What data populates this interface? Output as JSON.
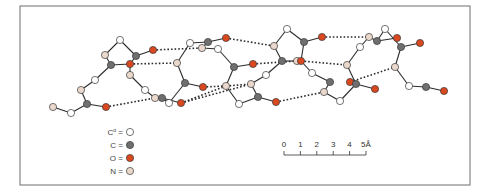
{
  "figure": {
    "frame": {
      "x": 20,
      "y": 6,
      "w": 450,
      "h": 179,
      "stroke": "#6e6e6e"
    },
    "colors": {
      "calpha": "#ffffff",
      "carbon": "#6f6f6f",
      "oxygen": "#d9481f",
      "nitrogen": "#ead8cc",
      "atom_stroke": "#3a3a3a",
      "bond": "#2b2b2b",
      "hbond": "#2b2b2b"
    },
    "atoms": [
      {
        "id": "a1",
        "type": "N",
        "x": 53,
        "y": 107
      },
      {
        "id": "a2",
        "type": "CA",
        "x": 71,
        "y": 113
      },
      {
        "id": "a3",
        "type": "C",
        "x": 87,
        "y": 104
      },
      {
        "id": "a4",
        "type": "O",
        "x": 106,
        "y": 107
      },
      {
        "id": "a5",
        "type": "N",
        "x": 81,
        "y": 90
      },
      {
        "id": "a6",
        "type": "CA",
        "x": 95,
        "y": 80
      },
      {
        "id": "a7",
        "type": "C",
        "x": 111,
        "y": 65
      },
      {
        "id": "a8",
        "type": "N",
        "x": 105,
        "y": 55
      },
      {
        "id": "a9",
        "type": "CA",
        "x": 120,
        "y": 40
      },
      {
        "id": "a10",
        "type": "C",
        "x": 136,
        "y": 56
      },
      {
        "id": "a11",
        "type": "O",
        "x": 153,
        "y": 50
      },
      {
        "id": "a12",
        "type": "O",
        "x": 130,
        "y": 64
      },
      {
        "id": "a13",
        "type": "N",
        "x": 130,
        "y": 75
      },
      {
        "id": "a14",
        "type": "CA",
        "x": 145,
        "y": 90
      },
      {
        "id": "a15",
        "type": "N",
        "x": 155,
        "y": 98
      },
      {
        "id": "a16",
        "type": "C",
        "x": 162,
        "y": 98
      },
      {
        "id": "a17",
        "type": "CA",
        "x": 169,
        "y": 103
      },
      {
        "id": "a18",
        "type": "O",
        "x": 181,
        "y": 103
      },
      {
        "id": "a19",
        "type": "C",
        "x": 185,
        "y": 83
      },
      {
        "id": "a20",
        "type": "O",
        "x": 203,
        "y": 87
      },
      {
        "id": "a21",
        "type": "N",
        "x": 177,
        "y": 63
      },
      {
        "id": "a22",
        "type": "CA",
        "x": 190,
        "y": 43
      },
      {
        "id": "a23",
        "type": "N",
        "x": 202,
        "y": 48
      },
      {
        "id": "a24",
        "type": "C",
        "x": 208,
        "y": 42
      },
      {
        "id": "a25",
        "type": "O",
        "x": 226,
        "y": 38
      },
      {
        "id": "a26",
        "type": "CA",
        "x": 218,
        "y": 49
      },
      {
        "id": "a27",
        "type": "C",
        "x": 234,
        "y": 67
      },
      {
        "id": "a28",
        "type": "O",
        "x": 253,
        "y": 64
      },
      {
        "id": "a29",
        "type": "N",
        "x": 226,
        "y": 86
      },
      {
        "id": "a30",
        "type": "CA",
        "x": 239,
        "y": 104
      },
      {
        "id": "a31",
        "type": "C",
        "x": 258,
        "y": 97
      },
      {
        "id": "a32",
        "type": "O",
        "x": 276,
        "y": 102
      },
      {
        "id": "a33",
        "type": "N",
        "x": 251,
        "y": 84
      },
      {
        "id": "a34",
        "type": "CA",
        "x": 266,
        "y": 75
      },
      {
        "id": "a35",
        "type": "C",
        "x": 282,
        "y": 61
      },
      {
        "id": "a36",
        "type": "N",
        "x": 297,
        "y": 61
      },
      {
        "id": "a37",
        "type": "O",
        "x": 301,
        "y": 61
      },
      {
        "id": "a38",
        "type": "N",
        "x": 274,
        "y": 46
      },
      {
        "id": "a39",
        "type": "CA",
        "x": 287,
        "y": 29
      },
      {
        "id": "a40",
        "type": "C",
        "x": 304,
        "y": 42
      },
      {
        "id": "a41",
        "type": "O",
        "x": 322,
        "y": 37
      },
      {
        "id": "a42",
        "type": "CA",
        "x": 312,
        "y": 73
      },
      {
        "id": "a43",
        "type": "C",
        "x": 330,
        "y": 82
      },
      {
        "id": "a44",
        "type": "N",
        "x": 324,
        "y": 92
      },
      {
        "id": "a45",
        "type": "CA",
        "x": 340,
        "y": 101
      },
      {
        "id": "a46",
        "type": "O",
        "x": 350,
        "y": 82
      },
      {
        "id": "a47",
        "type": "C",
        "x": 356,
        "y": 84
      },
      {
        "id": "a48",
        "type": "O",
        "x": 375,
        "y": 89
      },
      {
        "id": "a49",
        "type": "N",
        "x": 347,
        "y": 65
      },
      {
        "id": "a50",
        "type": "CA",
        "x": 360,
        "y": 47
      },
      {
        "id": "a51",
        "type": "N",
        "x": 369,
        "y": 37
      },
      {
        "id": "a52",
        "type": "C",
        "x": 377,
        "y": 41
      },
      {
        "id": "a53",
        "type": "CA",
        "x": 385,
        "y": 29
      },
      {
        "id": "a54",
        "type": "O",
        "x": 397,
        "y": 38
      },
      {
        "id": "a55",
        "type": "C",
        "x": 401,
        "y": 47
      },
      {
        "id": "a56",
        "type": "O",
        "x": 420,
        "y": 43
      },
      {
        "id": "a57",
        "type": "N",
        "x": 395,
        "y": 67
      },
      {
        "id": "a58",
        "type": "CA",
        "x": 409,
        "y": 86
      },
      {
        "id": "a59",
        "type": "C",
        "x": 426,
        "y": 87
      },
      {
        "id": "a60",
        "type": "O",
        "x": 444,
        "y": 91
      }
    ],
    "bonds": [
      [
        "a1",
        "a2"
      ],
      [
        "a2",
        "a3"
      ],
      [
        "a3",
        "a4"
      ],
      [
        "a3",
        "a5"
      ],
      [
        "a5",
        "a6"
      ],
      [
        "a6",
        "a7"
      ],
      [
        "a7",
        "a8"
      ],
      [
        "a8",
        "a9"
      ],
      [
        "a9",
        "a10"
      ],
      [
        "a10",
        "a11"
      ],
      [
        "a7",
        "a12"
      ],
      [
        "a10",
        "a12"
      ],
      [
        "a12",
        "a13"
      ],
      [
        "a13",
        "a14"
      ],
      [
        "a14",
        "a15"
      ],
      [
        "a15",
        "a16"
      ],
      [
        "a16",
        "a17"
      ],
      [
        "a17",
        "a19"
      ],
      [
        "a19",
        "a20"
      ],
      [
        "a19",
        "a21"
      ],
      [
        "a21",
        "a22"
      ],
      [
        "a22",
        "a24"
      ],
      [
        "a23",
        "a24"
      ],
      [
        "a24",
        "a25"
      ],
      [
        "a23",
        "a26"
      ],
      [
        "a26",
        "a27"
      ],
      [
        "a27",
        "a28"
      ],
      [
        "a27",
        "a29"
      ],
      [
        "a29",
        "a30"
      ],
      [
        "a30",
        "a31"
      ],
      [
        "a31",
        "a32"
      ],
      [
        "a31",
        "a33"
      ],
      [
        "a33",
        "a34"
      ],
      [
        "a34",
        "a35"
      ],
      [
        "a35",
        "a38"
      ],
      [
        "a38",
        "a39"
      ],
      [
        "a39",
        "a40"
      ],
      [
        "a40",
        "a41"
      ],
      [
        "a35",
        "a36"
      ],
      [
        "a40",
        "a37"
      ],
      [
        "a37",
        "a42"
      ],
      [
        "a42",
        "a43"
      ],
      [
        "a43",
        "a44"
      ],
      [
        "a44",
        "a45"
      ],
      [
        "a45",
        "a47"
      ],
      [
        "a46",
        "a47"
      ],
      [
        "a47",
        "a48"
      ],
      [
        "a47",
        "a49"
      ],
      [
        "a49",
        "a50"
      ],
      [
        "a50",
        "a51"
      ],
      [
        "a51",
        "a52"
      ],
      [
        "a52",
        "a53"
      ],
      [
        "a53",
        "a55"
      ],
      [
        "a52",
        "a54"
      ],
      [
        "a55",
        "a56"
      ],
      [
        "a55",
        "a57"
      ],
      [
        "a57",
        "a58"
      ],
      [
        "a58",
        "a59"
      ],
      [
        "a59",
        "a60"
      ],
      [
        "a16",
        "a18"
      ]
    ],
    "hbonds": [
      [
        "a4",
        "a15"
      ],
      [
        "a11",
        "a23"
      ],
      [
        "a12",
        "a21"
      ],
      [
        "a18",
        "a29"
      ],
      [
        "a20",
        "a29"
      ],
      [
        "a29",
        "a33"
      ],
      [
        "a25",
        "a38"
      ],
      [
        "a28",
        "a36"
      ],
      [
        "a32",
        "a44"
      ],
      [
        "a41",
        "a51"
      ],
      [
        "a37",
        "a49"
      ],
      [
        "a46",
        "a57"
      ],
      [
        "a18",
        "a33"
      ]
    ],
    "legend": {
      "items": [
        {
          "label": "C",
          "sup": "α",
          "eq": "=",
          "type": "CA"
        },
        {
          "label": "C",
          "sup": "",
          "eq": "=",
          "type": "C"
        },
        {
          "label": "O",
          "sup": "",
          "eq": "=",
          "type": "O"
        },
        {
          "label": "N",
          "sup": "",
          "eq": "=",
          "type": "N"
        }
      ]
    },
    "scale_bar": {
      "ticks": [
        "0",
        "1",
        "2",
        "3",
        "4",
        "5"
      ],
      "unit": "Å",
      "x0": 284,
      "x1": 366,
      "y": 155
    }
  }
}
